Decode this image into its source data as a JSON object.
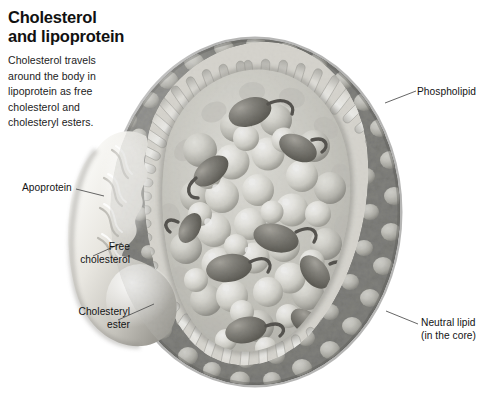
{
  "figure": {
    "title_line1": "Cholesterol",
    "title_line2": "and lipoprotein",
    "caption_line1": "Cholesterol travels",
    "caption_line2": "around the body in",
    "caption_line3": "lipoprotein as free",
    "caption_line4": "cholesterol and",
    "caption_line5": "cholesteryl esters.",
    "background_color": "#ffffff",
    "ink_color": "#141414",
    "illustration_style": "grayscale airbrush cutaway"
  },
  "callouts": {
    "phospholipid": {
      "line1": "Phospholipid"
    },
    "apoprotein": {
      "line1": "Apoprotein"
    },
    "free_cholesterol": {
      "line1": "Free",
      "line2": "cholesterol"
    },
    "cholesteryl_ester": {
      "line1": "Cholesteryl",
      "line2": "ester"
    },
    "neutral_lipid": {
      "line1": "Neutral lipid",
      "line2": "(in the core)"
    }
  },
  "palette": {
    "outer_shell_dark": "#4a4a4a",
    "outer_shell_mid": "#8d8d8d",
    "membrane_rod_light": "#f2f2f0",
    "membrane_rod_shadow": "#b9b9b6",
    "core_sphere_light": "#f0efe9",
    "core_sphere_shadow": "#9d9c94",
    "ester_dark": "#595751",
    "apoprotein_light": "#ebe9e4",
    "apoprotein_shadow": "#a9a7a1",
    "leader_line": "#555555"
  }
}
